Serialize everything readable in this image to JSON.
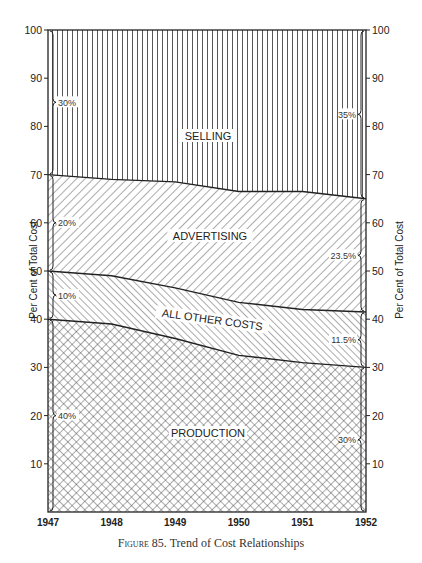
{
  "chart_data": {
    "type": "area",
    "stacked": true,
    "percent": true,
    "title": "",
    "caption": {
      "figure_label": "Figure 85.",
      "text": "Trend of Cost Relationships"
    },
    "xlabel": "",
    "ylabel": "Per Cent of Total Cost",
    "ylabel_right": "Per Cent of Total Cost",
    "x": [
      1947,
      1948,
      1949,
      1950,
      1951,
      1952
    ],
    "x_tick_labels": [
      "1947",
      "1948",
      "1949",
      "1950",
      "1951",
      "1952"
    ],
    "y_ticks": [
      10,
      20,
      30,
      40,
      50,
      60,
      70,
      80,
      90,
      100
    ],
    "y_tick_labels": [
      "10",
      "20",
      "30",
      "40",
      "50",
      "60",
      "70",
      "80",
      "90",
      "100"
    ],
    "ylim": [
      0,
      100
    ],
    "grid": false,
    "legend": "inline labels",
    "boundaries": {
      "production_top": [
        40,
        39,
        36,
        32.5,
        31,
        30
      ],
      "other_costs_top": [
        50,
        49,
        46.5,
        43.5,
        42,
        41.5
      ],
      "advertising_top": [
        70,
        69,
        68.5,
        66.5,
        66.5,
        65
      ]
    },
    "series": [
      {
        "name": "PRODUCTION",
        "values": [
          40,
          39,
          36,
          32.5,
          31,
          30
        ],
        "pattern": "crosshatch",
        "start_label": "40%",
        "end_label": "30%"
      },
      {
        "name": "ALL OTHER COSTS",
        "values": [
          10,
          10,
          10.5,
          11,
          11,
          11.5
        ],
        "pattern": "diagonal-backslash",
        "start_label": "10%",
        "end_label": "11.5%"
      },
      {
        "name": "ADVERTISING",
        "values": [
          20,
          20,
          22,
          23,
          24.5,
          23.5
        ],
        "pattern": "diagonal-slash",
        "start_label": "20%",
        "end_label": "23.5%"
      },
      {
        "name": "SELLING",
        "values": [
          30,
          31,
          31.5,
          33.5,
          33.5,
          35
        ],
        "pattern": "vertical-lines",
        "start_label": "30%",
        "end_label": "35%"
      }
    ],
    "colors": {
      "ink": "#222222",
      "paper": "#ffffff",
      "fill": "#555555"
    }
  }
}
